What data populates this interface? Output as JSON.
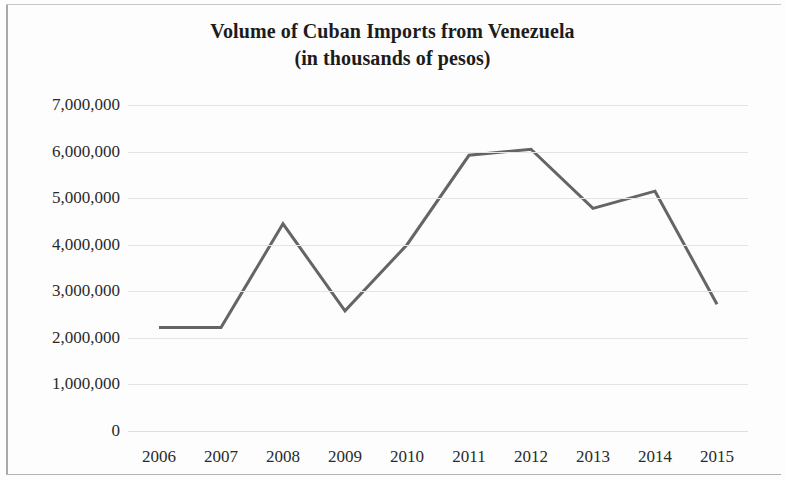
{
  "chart_data": {
    "type": "line",
    "title": "Volume of Cuban Imports from Venezuela",
    "subtitle": "(in thousands of pesos)",
    "xlabel": "",
    "ylabel": "",
    "categories": [
      "2006",
      "2007",
      "2008",
      "2009",
      "2010",
      "2011",
      "2012",
      "2013",
      "2014",
      "2015"
    ],
    "values": [
      2220000,
      2220000,
      4450000,
      2580000,
      4000000,
      5920000,
      6050000,
      4780000,
      5150000,
      2720000
    ],
    "series": [
      {
        "name": "Volume of Cuban Imports from Venezuela",
        "values": [
          2220000,
          2220000,
          4450000,
          2580000,
          4000000,
          5920000,
          6050000,
          4780000,
          5150000,
          2720000
        ]
      }
    ],
    "ylim": [
      0,
      7000000
    ],
    "yticks": [
      0,
      1000000,
      2000000,
      3000000,
      4000000,
      5000000,
      6000000,
      7000000
    ],
    "ytick_labels": [
      "0",
      "1,000,000",
      "2,000,000",
      "3,000,000",
      "4,000,000",
      "5,000,000",
      "6,000,000",
      "7,000,000"
    ],
    "xtick_labels": [
      "2006",
      "2007",
      "2008",
      "2009",
      "2010",
      "2011",
      "2012",
      "2013",
      "2014",
      "2015"
    ],
    "grid": "horizontal",
    "legend": "none",
    "line_color": "#656565",
    "line_width": 3,
    "markers": "none",
    "background_color": "#fdfdfd",
    "gridline_color": "#e4e4e4",
    "text_color": "#2a2a2a"
  }
}
